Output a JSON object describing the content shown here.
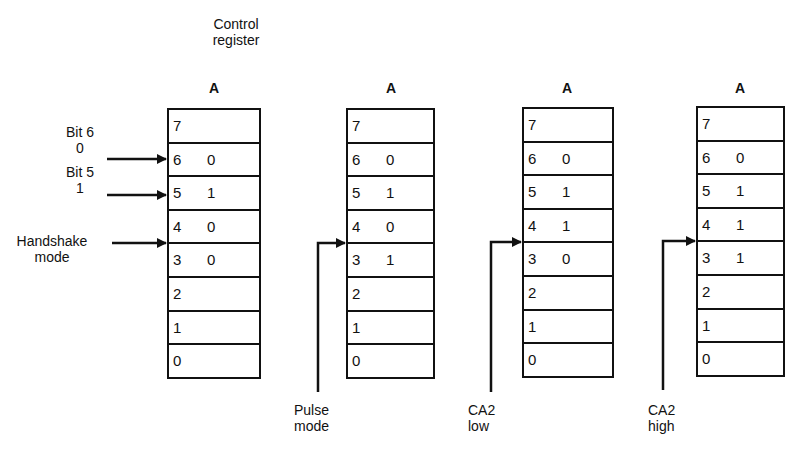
{
  "header": {
    "title_line1": "Control",
    "title_line2": "register"
  },
  "registers": [
    {
      "label": "A",
      "bits": [
        {
          "num": "7",
          "val": ""
        },
        {
          "num": "6",
          "val": "0"
        },
        {
          "num": "5",
          "val": "1"
        },
        {
          "num": "4",
          "val": "0"
        },
        {
          "num": "3",
          "val": "0"
        },
        {
          "num": "2",
          "val": ""
        },
        {
          "num": "1",
          "val": ""
        },
        {
          "num": "0",
          "val": ""
        }
      ]
    },
    {
      "label": "A",
      "bits": [
        {
          "num": "7",
          "val": ""
        },
        {
          "num": "6",
          "val": "0"
        },
        {
          "num": "5",
          "val": "1"
        },
        {
          "num": "4",
          "val": "0"
        },
        {
          "num": "3",
          "val": "1"
        },
        {
          "num": "2",
          "val": ""
        },
        {
          "num": "1",
          "val": ""
        },
        {
          "num": "0",
          "val": ""
        }
      ],
      "mode_label_line1": "Pulse",
      "mode_label_line2": "mode"
    },
    {
      "label": "A",
      "bits": [
        {
          "num": "7",
          "val": ""
        },
        {
          "num": "6",
          "val": "0"
        },
        {
          "num": "5",
          "val": "1"
        },
        {
          "num": "4",
          "val": "1"
        },
        {
          "num": "3",
          "val": "0"
        },
        {
          "num": "2",
          "val": ""
        },
        {
          "num": "1",
          "val": ""
        },
        {
          "num": "0",
          "val": ""
        }
      ],
      "mode_label_line1": "CA2",
      "mode_label_line2": "low"
    },
    {
      "label": "A",
      "bits": [
        {
          "num": "7",
          "val": ""
        },
        {
          "num": "6",
          "val": "0"
        },
        {
          "num": "5",
          "val": "1"
        },
        {
          "num": "4",
          "val": "1"
        },
        {
          "num": "3",
          "val": "1"
        },
        {
          "num": "2",
          "val": ""
        },
        {
          "num": "1",
          "val": ""
        },
        {
          "num": "0",
          "val": ""
        }
      ],
      "mode_label_line1": "CA2",
      "mode_label_line2": "high"
    }
  ],
  "left_annotations": {
    "bit6_line1": "Bit 6",
    "bit6_line2": "0",
    "bit5_line1": "Bit 5",
    "bit5_line2": "1",
    "handshake_line1": "Handshake",
    "handshake_line2": "mode"
  },
  "colors": {
    "ink": "#111111",
    "paper": "#ffffff"
  }
}
